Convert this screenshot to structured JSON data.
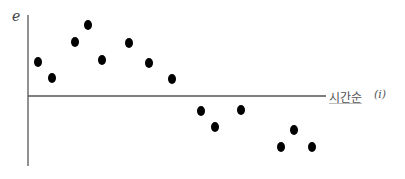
{
  "chart_data": {
    "type": "scatter",
    "title": "",
    "xlabel": "시간순",
    "xlabel_var": "(i)",
    "ylabel": "e",
    "grid": false,
    "legend": null,
    "points_px": [
      {
        "x": 38,
        "y": 62
      },
      {
        "x": 52,
        "y": 78
      },
      {
        "x": 75,
        "y": 42
      },
      {
        "x": 88,
        "y": 25
      },
      {
        "x": 102,
        "y": 60
      },
      {
        "x": 129,
        "y": 43
      },
      {
        "x": 149,
        "y": 63
      },
      {
        "x": 172,
        "y": 79
      },
      {
        "x": 201,
        "y": 111
      },
      {
        "x": 215,
        "y": 127
      },
      {
        "x": 241,
        "y": 110
      },
      {
        "x": 281,
        "y": 147
      },
      {
        "x": 294,
        "y": 130
      },
      {
        "x": 312,
        "y": 147
      }
    ],
    "x": [
      1,
      2,
      3,
      4,
      5,
      6,
      7,
      8,
      9,
      10,
      11,
      12,
      13,
      14
    ],
    "values": [
      1.0,
      0.5,
      1.6,
      2.1,
      1.1,
      1.6,
      1.0,
      0.5,
      -0.5,
      -1.0,
      -0.5,
      -1.6,
      -1.1,
      -1.6
    ],
    "axes_px": {
      "origin_x": 28,
      "zero_y": 96,
      "y_top": 15,
      "y_bottom": 166,
      "x_right": 326
    }
  }
}
